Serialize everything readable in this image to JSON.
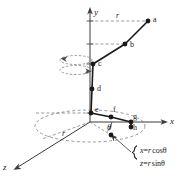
{
  "figure": {
    "background": "#ffffff",
    "ink": "#1a1a1a"
  },
  "axes": {
    "y_label": "y",
    "x_label": "x",
    "z_label": "z",
    "origin": [
      90,
      122
    ]
  },
  "radius_labels": {
    "top": "r",
    "floor": "r"
  },
  "angle_label": "θ",
  "points": [
    {
      "id": "a",
      "label": "a",
      "cx": 148,
      "cy": 21,
      "lx": 153,
      "ly": 16
    },
    {
      "id": "b",
      "label": "b",
      "cx": 125,
      "cy": 44,
      "lx": 130,
      "ly": 41
    },
    {
      "id": "c",
      "label": "c",
      "cx": 93,
      "cy": 64,
      "lx": 98,
      "ly": 60
    },
    {
      "id": "d",
      "label": "d",
      "cx": 92,
      "cy": 89,
      "lx": 97,
      "ly": 85
    },
    {
      "id": "e",
      "label": "e",
      "cx": 91,
      "cy": 113,
      "lx": 95,
      "ly": 106
    },
    {
      "id": "f",
      "label": "f",
      "cx": 111,
      "cy": 117,
      "lx": 113,
      "ly": 106
    },
    {
      "id": "g",
      "label": "g",
      "cx": 131,
      "cy": 122,
      "lx": 133,
      "ly": 113
    },
    {
      "id": "h",
      "label": "h",
      "cx": 131,
      "cy": 127,
      "lx": 133,
      "ly": 124
    },
    {
      "id": "p",
      "label": "",
      "cx": 111,
      "cy": 135,
      "lx": 0,
      "ly": 0
    }
  ],
  "equations": {
    "line1_lhs": "x",
    "line1_eq": "=",
    "line1_rhs_var": "r",
    "line1_rhs_fn": "cosθ",
    "line2_lhs": "z",
    "line2_eq": "=",
    "line2_rhs_var": "r",
    "line2_rhs_fn": "sinθ",
    "brace": "{"
  },
  "annotations": {
    "rotation_arrows": "curved-rotation-arrows-at-point-c",
    "floor_circle": "dashed-ellipse-radius-circle",
    "callout_arrow": "arrow-from-equations-to-floor-point"
  }
}
